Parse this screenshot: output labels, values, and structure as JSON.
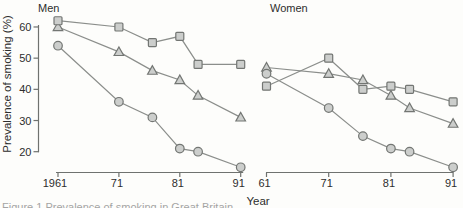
{
  "figure": {
    "ylabel": "Prevalence of smoking (%)",
    "xlabel": "Year",
    "caption_fragment": "Figure 1 Prevalence of smoking in Great Britain",
    "colors": {
      "marker_fill": "#cccecc",
      "marker_stroke": "#737673",
      "line": "#8b8e8b",
      "axis": "#6f726f",
      "text": "#2d2d2d",
      "background": "#fdfdfb"
    }
  },
  "chart_data": [
    {
      "type": "line",
      "title": "Men",
      "x": [
        1961,
        1971,
        1976.5,
        1981,
        1984,
        1991
      ],
      "xtick_years": [
        1961,
        1971,
        1981,
        1991
      ],
      "xtick_labels": [
        "1961",
        "71",
        "81",
        "91"
      ],
      "yticks": [
        20,
        30,
        40,
        50,
        60
      ],
      "ylim": [
        20,
        60
      ],
      "grid": false,
      "legend": "none",
      "series": [
        {
          "name": "square-series",
          "marker": "square",
          "values": [
            62,
            60,
            55,
            57,
            48,
            48
          ]
        },
        {
          "name": "triangle-series",
          "marker": "triangle",
          "values": [
            60,
            52,
            46,
            43,
            38,
            31
          ]
        },
        {
          "name": "circle-series",
          "marker": "circle",
          "values": [
            54,
            36,
            31,
            21,
            20,
            15
          ]
        }
      ]
    },
    {
      "type": "line",
      "title": "Women",
      "x": [
        1961,
        1971,
        1976.5,
        1981,
        1984,
        1991
      ],
      "xtick_years": [
        1961,
        1971,
        1981,
        1991
      ],
      "xtick_labels": [
        "61",
        "71",
        "81",
        "91"
      ],
      "yticks": [
        20,
        30,
        40,
        50,
        60
      ],
      "ylim": [
        20,
        60
      ],
      "grid": false,
      "legend": "none",
      "series": [
        {
          "name": "square-series",
          "marker": "square",
          "values": [
            41,
            50,
            40,
            41,
            40,
            36
          ]
        },
        {
          "name": "triangle-series",
          "marker": "triangle",
          "values": [
            47,
            45,
            43,
            38,
            34,
            29
          ]
        },
        {
          "name": "circle-series",
          "marker": "circle",
          "values": [
            45,
            34,
            25,
            21,
            20,
            15
          ]
        }
      ]
    }
  ]
}
